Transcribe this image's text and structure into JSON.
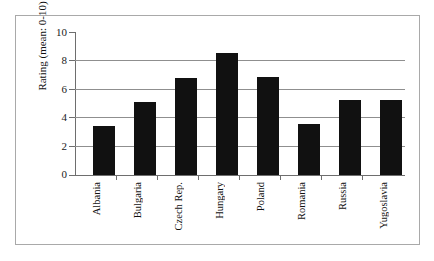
{
  "chart_data": {
    "type": "bar",
    "title": "",
    "subtitle": "",
    "xlabel": "",
    "ylabel": "Rating (mean: 0-10)",
    "categories": [
      "Albania",
      "Bulgaria",
      "Czech Rep.",
      "Hungary",
      "Poland",
      "Romania",
      "Russia",
      "Yugoslavia"
    ],
    "values": [
      3.4,
      5.1,
      6.8,
      8.5,
      6.85,
      3.55,
      5.25,
      5.25
    ],
    "ylim": [
      0,
      10
    ],
    "yticks": [
      0,
      2,
      4,
      6,
      8,
      10
    ],
    "ytick_labels": [
      "0",
      "2",
      "4",
      "6",
      "8",
      "10"
    ],
    "gridlines": [
      2,
      4,
      6,
      8
    ],
    "grid": true,
    "legend": "none",
    "bar_color": "#111111",
    "grid_color": "#8f8f8f",
    "axis_color": "#6e6e6e",
    "frame_color": "#a9a9a9"
  }
}
